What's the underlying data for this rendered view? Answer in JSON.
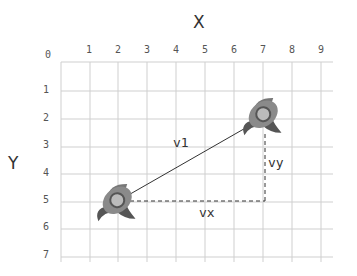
{
  "diagram": {
    "x_axis_title": "X",
    "y_axis_title": "Y",
    "origin_label": "0",
    "x_ticks": [
      "1",
      "2",
      "3",
      "4",
      "5",
      "6",
      "7",
      "8",
      "9"
    ],
    "y_ticks": [
      "1",
      "2",
      "3",
      "4",
      "5",
      "6",
      "7"
    ],
    "vector_label": "v1",
    "vx_label": "vx",
    "vy_label": "vy",
    "start_point": {
      "x": 2,
      "y": 5,
      "icon": "rocket-icon"
    },
    "end_point": {
      "x": 7,
      "y": 2,
      "icon": "rocket-icon"
    },
    "colors": {
      "grid": "#cccccc",
      "line": "#333333",
      "rocket": "#666666"
    }
  }
}
